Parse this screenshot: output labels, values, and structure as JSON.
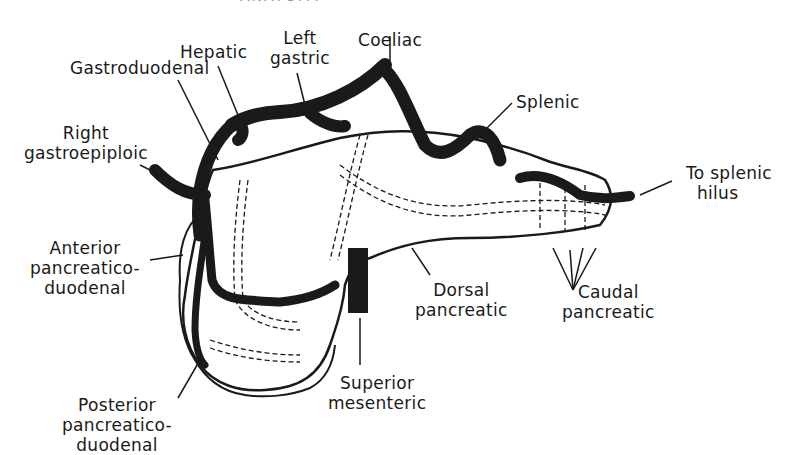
{
  "diagram": {
    "header": "ANATOMY",
    "colors": {
      "artery": "#1a1a1a",
      "outline": "#1a1a1a",
      "background": "#ffffff"
    },
    "labels": {
      "hepatic": "Hepatic",
      "left_gastric": [
        "Left",
        "gastric"
      ],
      "coeliac": "Coeliac",
      "gastroduodenal": "Gastroduodenal",
      "splenic": "Splenic",
      "right_gastroepiploic": [
        "Right",
        "gastroepiploic"
      ],
      "to_splenic_hilus": [
        "To splenic",
        "hilus"
      ],
      "anterior_pancreaticoduodenal": [
        "Anterior",
        "pancreatico-",
        "duodenal"
      ],
      "dorsal_pancreatic": [
        "Dorsal",
        "pancreatic"
      ],
      "caudal_pancreatic": [
        "Caudal",
        "pancreatic"
      ],
      "superior_mesenteric": [
        "Superior",
        "mesenteric"
      ],
      "posterior_pancreaticoduodenal": [
        "Posterior",
        "pancreatico-",
        "duodenal"
      ]
    }
  }
}
